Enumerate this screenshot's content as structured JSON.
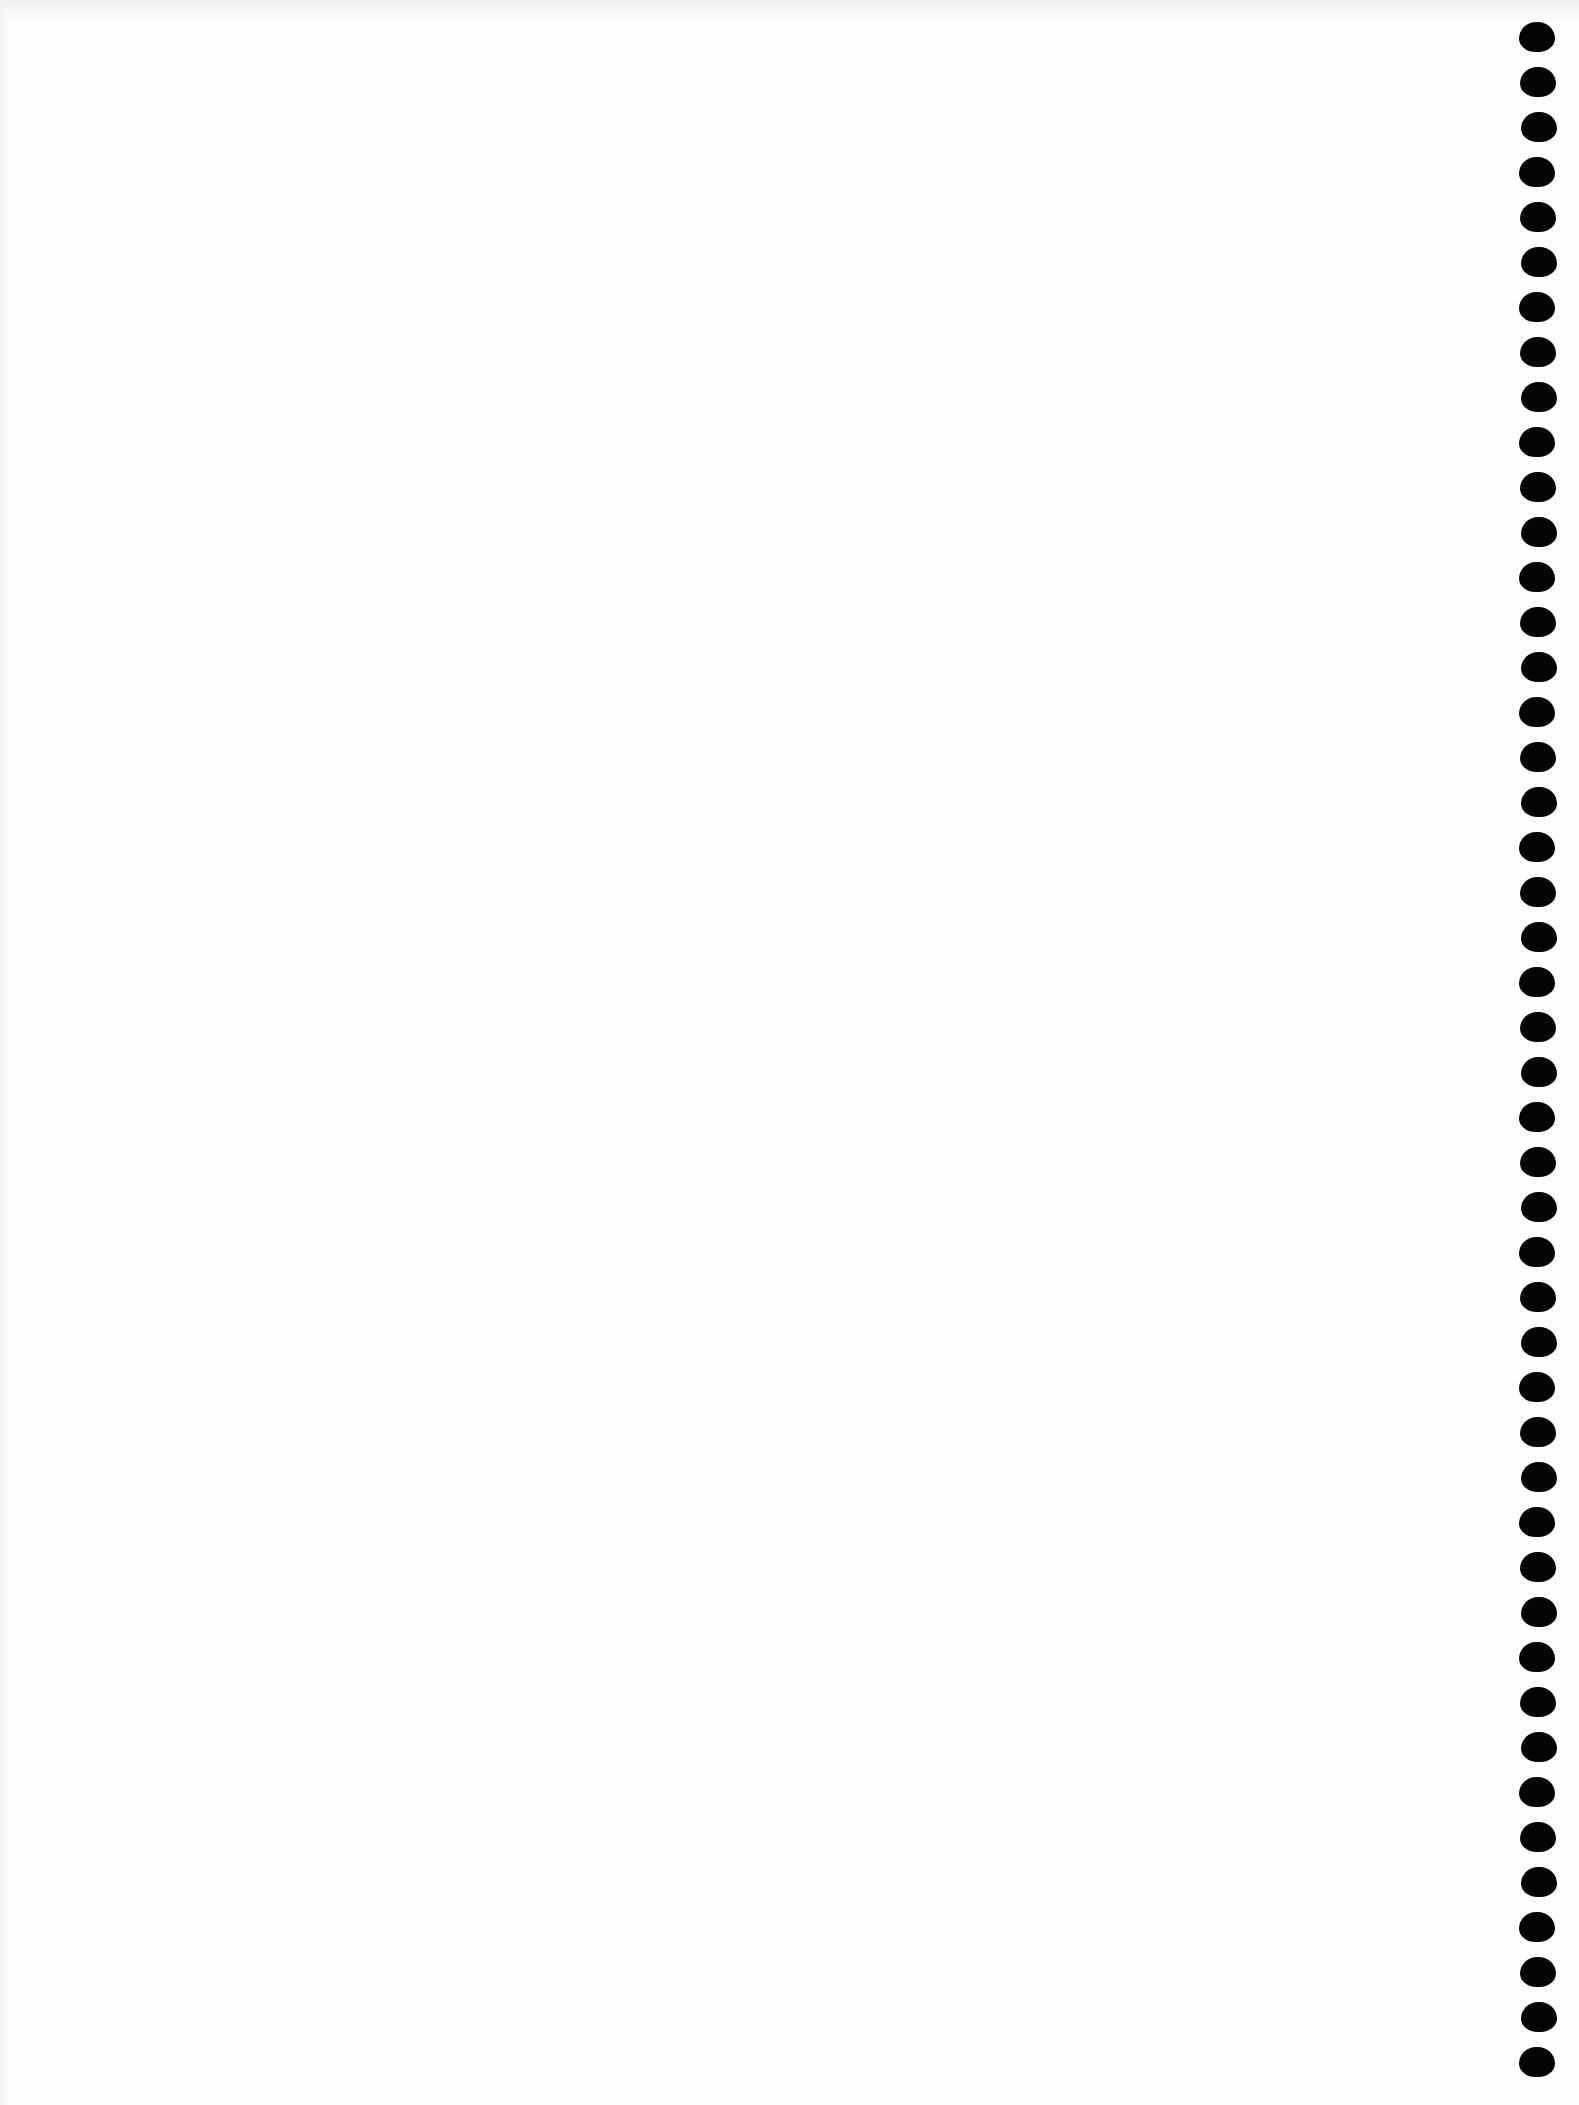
{
  "page": {
    "type": "blank notebook page",
    "background_color": "#fefefe",
    "text_content": ""
  },
  "spiral_binding": {
    "side": "right",
    "hole_color": "#050505",
    "hole_count": 46,
    "first_hole_top": 22,
    "hole_pitch": 45,
    "hole_width": 36,
    "hole_height": 30,
    "center_x": 1538
  }
}
